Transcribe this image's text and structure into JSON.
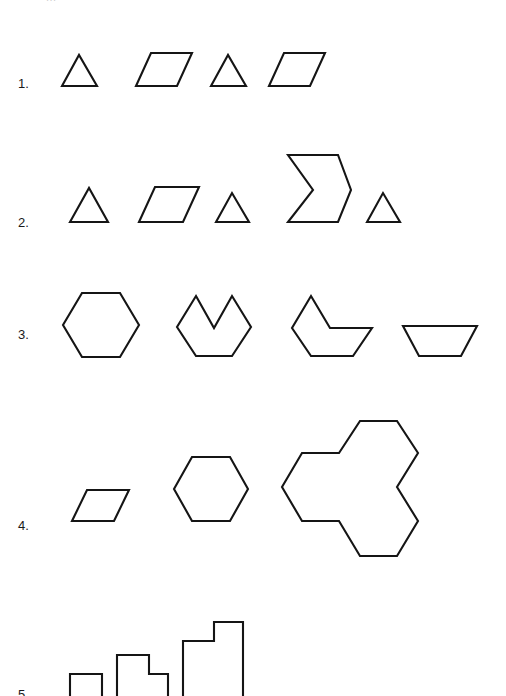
{
  "page": {
    "width": 506,
    "height": 696,
    "background": "#ffffff",
    "stroke_color": "#151515",
    "fill_color": "#ffffff",
    "stroke_width": 2.1,
    "clipped_header_text": "..."
  },
  "rows": [
    {
      "label": "1.",
      "label_x": 18,
      "label_y": 77,
      "description": "alternating triangle and parallelogram",
      "shape_count": 4,
      "shapes": [
        {
          "name": "triangle",
          "points": "62,86 79,55 97,86"
        },
        {
          "name": "parallelogram",
          "points": "136,86 151,53 192,53 177,86"
        },
        {
          "name": "triangle",
          "points": "211,86 228,55 246,86"
        },
        {
          "name": "parallelogram",
          "points": "269,86 284,53 325,53 310,86"
        }
      ]
    },
    {
      "label": "2.",
      "label_x": 18,
      "label_y": 216,
      "description": "triangle, parallelogram, triangle, chevron, triangle",
      "shape_count": 5,
      "shapes": [
        {
          "name": "triangle",
          "points": "70,222 89,188 108,222"
        },
        {
          "name": "parallelogram",
          "points": "139,222 155,187 199,187 183,222"
        },
        {
          "name": "triangle",
          "points": "216,222 232,193 249,222"
        },
        {
          "name": "chevron",
          "points": "288,155 338,155 351,190 338,222 288,222 313,190"
        },
        {
          "name": "triangle",
          "points": "367,222 383,193 400,222"
        }
      ]
    },
    {
      "label": "3.",
      "label_x": 18,
      "label_y": 328,
      "description": "hexagon, hexagon with v-notch, hexagon with wedge cut, trapezoid",
      "shape_count": 4,
      "shapes": [
        {
          "name": "hexagon",
          "points": "82,293 120,293 139,325 120,357 82,357 63,325"
        },
        {
          "name": "hexagon-with-notch",
          "points": "196,296 214,328 232,296 251,327 232,356 196,356 177,327"
        },
        {
          "name": "hexagon-with-wedge-cut",
          "points": "311,296 330,328 372,328 353,356 311,356 292,328"
        },
        {
          "name": "trapezoid",
          "points": "403,326 477,326 461,356 419,356"
        }
      ]
    },
    {
      "label": "4.",
      "label_x": 18,
      "label_y": 519,
      "description": "small parallelogram, hexagon, triple-hexagon cluster",
      "shape_count": 3,
      "shapes": [
        {
          "name": "parallelogram",
          "points": "72,521 87,490 129,490 114,521"
        },
        {
          "name": "hexagon",
          "points": "192,457 230,457 248,489 230,521 192,521 174,489"
        },
        {
          "name": "hexagon-cluster-triple",
          "points": "360,421 397,421 418,453 397,487 418,521 397,556 360,556 339,521 302,521 282,487 302,453 339,453"
        }
      ]
    },
    {
      "label": "5.",
      "label_x": 18,
      "label_y": 688,
      "description": "growing staircase polyomino shapes, cropped at bottom edge",
      "shape_count": 3,
      "shapes": [
        {
          "name": "square",
          "points": "70,674 102,674 102,710 70,710"
        },
        {
          "name": "l-shape-small",
          "points": "117,655 149,655 149,674 168,674 168,710 117,710"
        },
        {
          "name": "l-shape-large",
          "points": "183,641 214,641 214,622 243,622 243,710 183,710"
        }
      ]
    }
  ]
}
